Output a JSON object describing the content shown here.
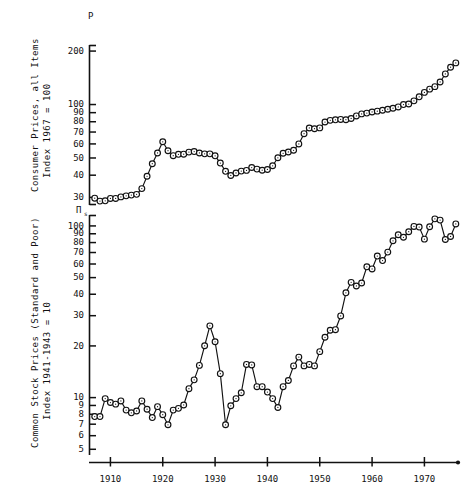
{
  "figure": {
    "background": "#ffffff",
    "ink": "#111111",
    "marker_fill": "#ffffff",
    "marker_stroke": "#111111"
  },
  "panels": [
    {
      "id": "consumer-prices",
      "symbol": "P",
      "symbol_sub": "",
      "axis_title_line1": "Consumer Prices, all Items",
      "axis_title_line2": "Index 1967 = 100",
      "yticks": [
        200,
        100,
        90,
        80,
        70,
        60,
        50,
        40,
        30
      ],
      "ylabels": [
        "200",
        "100",
        "90",
        "80",
        "70",
        "60",
        "50",
        "40",
        "30"
      ],
      "ylim": [
        27,
        215
      ],
      "scale": "log"
    },
    {
      "id": "common-stock-prices",
      "symbol": "Π",
      "symbol_sub": "s",
      "axis_title_line1": "Common Stock Prices (Standard and Poor)",
      "axis_title_line2": "Index 1941-1943 = 10",
      "yticks": [
        100,
        90,
        80,
        70,
        60,
        50,
        40,
        30,
        20,
        10,
        9,
        8,
        7,
        6,
        5
      ],
      "ylabels": [
        "100",
        "90",
        "80",
        "70",
        "60",
        "50",
        "40",
        "30",
        "20",
        "10",
        "9",
        "8",
        "7",
        "6",
        "5"
      ],
      "ylim": [
        4.6,
        115
      ],
      "scale": "log"
    }
  ],
  "xaxis": {
    "ticks": [
      1910,
      1920,
      1930,
      1940,
      1950,
      1960,
      1970
    ],
    "labels": [
      "1910",
      "1920",
      "1930",
      "1940",
      "1950",
      "1960",
      "1970"
    ],
    "xlim": [
      1906,
      1977
    ]
  },
  "chart_data": [
    {
      "type": "line",
      "id": "consumer-prices",
      "title": "Consumer Prices, all Items",
      "ylabel": "Consumer Prices, all Items  Index 1967 = 100",
      "xlabel": "",
      "series_name": "P",
      "yscale": "log",
      "ylim": [
        27,
        215
      ],
      "xlim": [
        1906,
        1977
      ],
      "grid": false,
      "legend": "none",
      "markers": "open-circle-with-dot",
      "x": [
        1907,
        1908,
        1909,
        1910,
        1911,
        1912,
        1913,
        1914,
        1915,
        1916,
        1917,
        1918,
        1919,
        1920,
        1921,
        1922,
        1923,
        1924,
        1925,
        1926,
        1927,
        1928,
        1929,
        1930,
        1931,
        1932,
        1933,
        1934,
        1935,
        1936,
        1937,
        1938,
        1939,
        1940,
        1941,
        1942,
        1943,
        1944,
        1945,
        1946,
        1947,
        1948,
        1949,
        1950,
        1951,
        1952,
        1953,
        1954,
        1955,
        1956,
        1957,
        1958,
        1959,
        1960,
        1961,
        1962,
        1963,
        1964,
        1965,
        1966,
        1967,
        1968,
        1969,
        1970,
        1971,
        1972,
        1973,
        1974,
        1975,
        1976
      ],
      "y": [
        29.5,
        28.4,
        28.5,
        29.4,
        29.4,
        30.0,
        30.4,
        30.7,
        31.0,
        33.4,
        39.2,
        46.1,
        53.0,
        61.3,
        54.6,
        51.2,
        52.1,
        52.2,
        53.6,
        54.0,
        53.0,
        52.4,
        52.4,
        51.1,
        46.5,
        41.8,
        39.6,
        40.9,
        41.9,
        42.3,
        43.9,
        43.0,
        42.4,
        42.8,
        44.9,
        49.8,
        52.8,
        53.7,
        54.9,
        59.6,
        68.1,
        73.3,
        72.6,
        73.4,
        79.2,
        80.9,
        81.5,
        81.9,
        81.6,
        82.9,
        85.7,
        88.0,
        88.9,
        90.2,
        91.2,
        92.2,
        93.5,
        94.7,
        96.3,
        99.3,
        100.0,
        104.2,
        109.8,
        116.3,
        121.3,
        125.3,
        133.1,
        147.7,
        161.2,
        170.5,
        178.0,
        182.0,
        186.0,
        190.0
      ],
      "annotations": []
    },
    {
      "type": "line",
      "id": "common-stock-prices",
      "title": "Common Stock Prices (Standard and Poor)",
      "ylabel": "Common Stock Prices (Standard and Poor)  Index 1941-1943 = 10",
      "xlabel": "",
      "series_name": "Πs",
      "yscale": "log",
      "ylim": [
        4.6,
        115
      ],
      "xlim": [
        1906,
        1977
      ],
      "grid": false,
      "legend": "none",
      "markers": "open-circle-with-dot",
      "x": [
        1907,
        1908,
        1909,
        1910,
        1911,
        1912,
        1913,
        1914,
        1915,
        1916,
        1917,
        1918,
        1919,
        1920,
        1921,
        1922,
        1923,
        1924,
        1925,
        1926,
        1927,
        1928,
        1929,
        1930,
        1931,
        1932,
        1933,
        1934,
        1935,
        1936,
        1937,
        1938,
        1939,
        1940,
        1941,
        1942,
        1943,
        1944,
        1945,
        1946,
        1947,
        1948,
        1949,
        1950,
        1951,
        1952,
        1953,
        1954,
        1955,
        1956,
        1957,
        1958,
        1959,
        1960,
        1961,
        1962,
        1963,
        1964,
        1965,
        1966,
        1967,
        1968,
        1969,
        1970,
        1971,
        1972,
        1973,
        1974,
        1975,
        1976
      ],
      "y": [
        7.7,
        7.7,
        9.8,
        9.3,
        9.1,
        9.5,
        8.4,
        8.1,
        8.3,
        9.5,
        8.5,
        7.6,
        8.8,
        7.9,
        6.9,
        8.4,
        8.6,
        9.0,
        11.2,
        12.6,
        15.3,
        19.9,
        26.0,
        21.0,
        13.7,
        6.9,
        8.9,
        9.8,
        10.6,
        15.5,
        15.4,
        11.5,
        11.5,
        10.7,
        9.8,
        8.7,
        11.5,
        12.5,
        15.2,
        17.1,
        15.2,
        15.5,
        15.2,
        18.4,
        22.3,
        24.5,
        24.7,
        29.7,
        40.5,
        46.6,
        44.4,
        46.2,
        57.4,
        55.8,
        66.3,
        62.4,
        69.9,
        81.4,
        88.2,
        85.3,
        91.9,
        98.7,
        97.8,
        83.2,
        98.3,
        109.2,
        107.4,
        82.8,
        86.2,
        102.0
      ],
      "annotations": []
    }
  ]
}
